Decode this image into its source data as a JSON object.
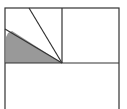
{
  "diagram": {
    "type": "geometry",
    "stroke_color": "#333333",
    "fill_color": "#999999",
    "background": "#ffffff",
    "outer_rect": {
      "x": 5,
      "y": 8,
      "w": 114,
      "h": 110
    },
    "divider_horizontal_y": 63,
    "divider_vertical_x": 62,
    "vertex": {
      "x": 62,
      "y": 63
    },
    "ray_upper_end": {
      "x": 29,
      "y": 8
    },
    "ray_lower_end": {
      "x": 5,
      "y": 29
    },
    "shaded_region": "wedge between left edge and lower ray, above horizontal divider"
  }
}
